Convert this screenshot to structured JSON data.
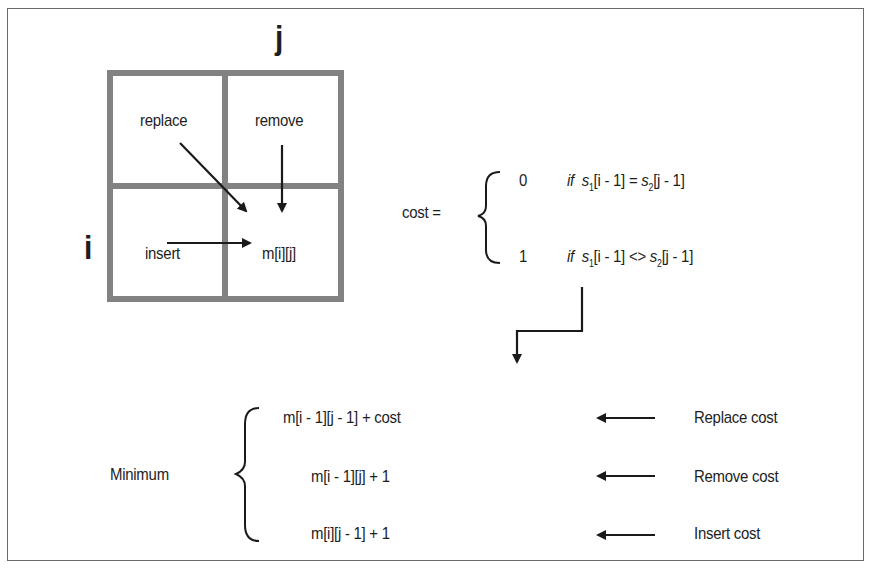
{
  "grid": {
    "col_label": "j",
    "row_label": "i",
    "cells": {
      "top_left": "replace",
      "top_right": "remove",
      "bottom_left": "insert",
      "bottom_right": "m[i][j]"
    },
    "border_color": "#808080"
  },
  "cost_definition": {
    "lhs": "cost =",
    "cases": [
      {
        "value": "0",
        "keyword": "if",
        "s1": "s",
        "s1_sub": "1",
        "s1_index": "[i - 1]",
        "op": "=",
        "s2": "s",
        "s2_sub": "2",
        "s2_index": "[j - 1]"
      },
      {
        "value": "1",
        "keyword": "if",
        "s1": "s",
        "s1_sub": "1",
        "s1_index": "[i - 1]",
        "op": "<>",
        "s2": "s",
        "s2_sub": "2",
        "s2_index": "[j - 1]"
      }
    ]
  },
  "minimum": {
    "label": "Minimum",
    "terms": [
      {
        "expr": "m[i - 1][j - 1] + cost",
        "annotation": "Replace cost"
      },
      {
        "expr": "m[i - 1][j] + 1",
        "annotation": "Remove cost"
      },
      {
        "expr": "m[i][j - 1] + 1",
        "annotation": "Insert cost"
      }
    ]
  }
}
